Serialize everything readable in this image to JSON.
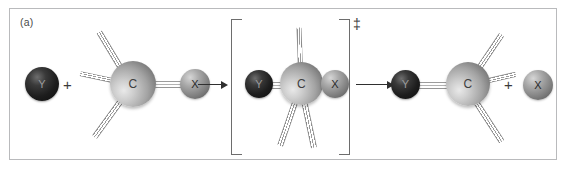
{
  "figure": {
    "panel_label": "(a)",
    "caption_alt": "SN2 reaction: nucleophile Y attacks carbon, displacing leaving group X through a trigonal bipyramidal transition state",
    "border_color": "#b9babc",
    "background_color": "#ffffff"
  },
  "symbols": {
    "plus": "+",
    "double_dagger": "‡",
    "arrow": "→"
  },
  "atoms": {
    "nucleophile": {
      "label": "Y",
      "color": "#1d1d1d",
      "role": "nucleophile"
    },
    "carbon": {
      "label": "C",
      "color": "#a3a3a3",
      "role": "central-carbon"
    },
    "leaving_group": {
      "label": "X",
      "color": "#7d7d7d",
      "role": "leaving-group"
    }
  },
  "stages": {
    "reactants": {
      "name": "reactants",
      "nucleophile_label": "Y",
      "carbon_label": "C",
      "leaving_group_label": "X",
      "plus_label": "+"
    },
    "transition_state": {
      "name": "transition-state",
      "nucleophile_label": "Y",
      "carbon_label": "C",
      "leaving_group_label": "X",
      "dagger_label": "‡"
    },
    "products": {
      "name": "products",
      "nucleophile_label": "Y",
      "carbon_label": "C",
      "leaving_group_label": "X",
      "plus_label": "+"
    }
  }
}
